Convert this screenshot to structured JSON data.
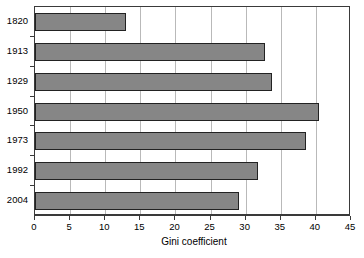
{
  "chart_data": {
    "type": "bar",
    "orientation": "horizontal",
    "title": "",
    "xlabel": "Gini coefficient",
    "ylabel": "",
    "categories": [
      "1820",
      "1913",
      "1929",
      "1950",
      "1973",
      "1992",
      "2004"
    ],
    "values": [
      13.0,
      32.8,
      33.8,
      40.4,
      38.6,
      31.8,
      29.0
    ],
    "series": [
      {
        "name": "Gini coefficient",
        "values": [
          13.0,
          32.8,
          33.8,
          40.4,
          38.6,
          31.8,
          29.0
        ]
      }
    ],
    "xlim": [
      0,
      45
    ],
    "xticks": [
      0,
      5,
      10,
      15,
      20,
      25,
      30,
      35,
      40,
      45
    ],
    "xtick_labels": [
      "0",
      "5",
      "10",
      "15",
      "20",
      "25",
      "30",
      "35",
      "40",
      "45"
    ],
    "grid": "vertical",
    "legend": false,
    "colors": {
      "bar_fill": "#868686",
      "bar_border": "#222222",
      "gridline": "#b9b9b9",
      "axis": "#3a3a3a",
      "background": "#ffffff",
      "text": "#000000"
    }
  }
}
